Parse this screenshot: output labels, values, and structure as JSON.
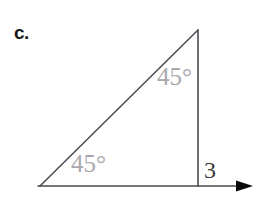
{
  "figure": {
    "part_letter": "c.",
    "shape": "right-triangle",
    "angles": [
      {
        "id": "top",
        "value": "45°",
        "position": "upper-right-interior"
      },
      {
        "id": "bottom_left",
        "value": "45°",
        "position": "lower-left-interior"
      }
    ],
    "side_labels": [
      {
        "id": "vertical-leg",
        "value": "3"
      }
    ],
    "colors": {
      "outline": "#4a4a52",
      "angle_text": "#a8a8ac",
      "side_text": "#3a3a3a",
      "letter_text": "#161616",
      "arrow": "#0a0a0a",
      "background": "#ffffff"
    },
    "geometry": {
      "apex": [
        198,
        30
      ],
      "bottom_left": [
        40,
        186
      ],
      "right_angle_corner": [
        198,
        186
      ],
      "ray_start": [
        38,
        186
      ],
      "ray_end": [
        252,
        186
      ]
    }
  }
}
